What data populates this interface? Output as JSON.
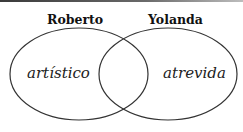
{
  "diagram": {
    "type": "venn",
    "sets": [
      {
        "name": "Roberto",
        "items": [
          "artístico"
        ]
      },
      {
        "name": "Yolanda",
        "items": [
          "atrevida"
        ]
      }
    ],
    "intersection": []
  }
}
